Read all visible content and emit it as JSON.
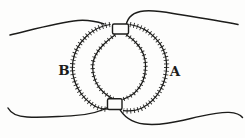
{
  "figure": {
    "left_half_label": "B",
    "right_half_label": "A",
    "ink_color": "#1c1c1a",
    "paper_color": "#fdfdfc"
  }
}
